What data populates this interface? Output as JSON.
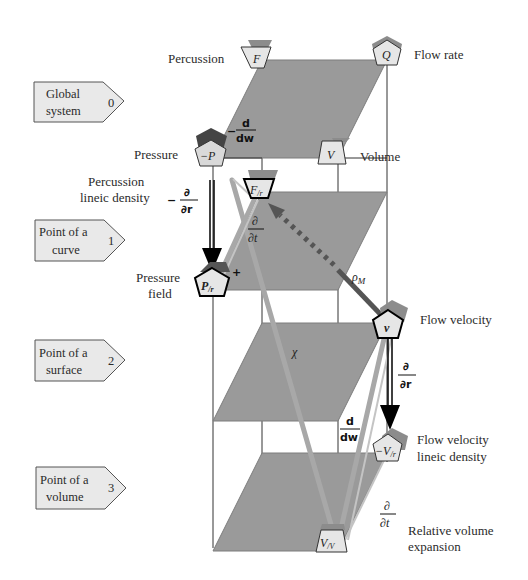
{
  "levels": [
    {
      "label_line1": "Global",
      "label_line2": "system",
      "index": "0"
    },
    {
      "label_line1": "Point of a",
      "label_line2": "curve",
      "index": "1"
    },
    {
      "label_line1": "Point of a",
      "label_line2": "surface",
      "index": "2"
    },
    {
      "label_line1": "Point of a",
      "label_line2": "volume",
      "index": "3"
    }
  ],
  "variables": {
    "percussion": {
      "name": "Percussion",
      "symbol": "F"
    },
    "flow_rate": {
      "name": "Flow rate",
      "symbol": "Q"
    },
    "volume": {
      "name": "Volume",
      "symbol": "V"
    },
    "pressure": {
      "name": "Pressure",
      "symbol": "−P"
    },
    "percussion_lineic": {
      "name_line1": "Percussion",
      "name_line2": "lineic density",
      "symbol": "F",
      "sub": "/r"
    },
    "pressure_field": {
      "name_line1": "Pressure",
      "name_line2": "field",
      "symbol": "P",
      "sub": "/r"
    },
    "flow_velocity": {
      "name": "Flow velocity",
      "symbol": "v"
    },
    "flow_velocity_lineic": {
      "name_line1": "Flow velocity",
      "name_line2": "lineic density",
      "symbol": "−V",
      "sub": "/r"
    },
    "relative_volume": {
      "name_line1": "Relative volume",
      "name_line2": "expansion",
      "symbol": "V",
      "sub": "/V"
    }
  },
  "operators": {
    "minus_d_dw_top": {
      "sign": "−",
      "num": "d",
      "den": "dw"
    },
    "minus_partial_r": {
      "sign": "−",
      "num": "∂",
      "den": "∂r"
    },
    "partial_t_upper": {
      "num": "∂",
      "den": "∂t"
    },
    "partial_r_right": {
      "num": "∂",
      "den": "∂r"
    },
    "d_dw_lower": {
      "num": "d",
      "den": "dw"
    },
    "partial_t_lower": {
      "num": "∂",
      "den": "∂t"
    },
    "rho_m": "ρ",
    "rho_m_sub": "M",
    "chi": "χ",
    "plus": "+"
  },
  "colors": {
    "plane": "#9a9a9a",
    "plane_edge": "#7d7d7d",
    "node_fill": "#e6e6e6",
    "node_shadow": "#8c8c8c",
    "level_box": "#e9e9e9",
    "arrow_gray": "#a8a8a8",
    "arrow_dark": "#555555"
  }
}
